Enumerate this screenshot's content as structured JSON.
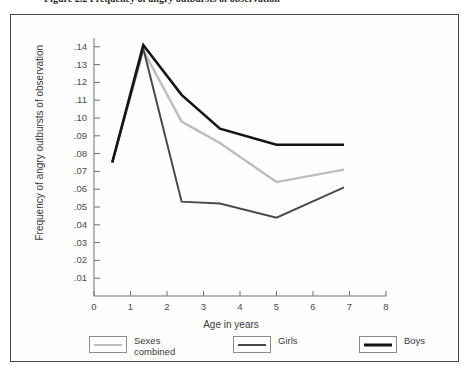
{
  "figure": {
    "caption": "Figure 2.2  Frequency of angry outbursts of observation"
  },
  "chart_data": {
    "type": "line",
    "title": "",
    "xlabel": "Age in years",
    "ylabel": "Frequency of angry outbursts of observation",
    "xlim": [
      0,
      8
    ],
    "ylim": [
      0,
      0.145
    ],
    "grid": false,
    "legend_position": "bottom",
    "xticks": [
      "0",
      "1",
      "2",
      "3",
      "4",
      "5",
      "6",
      "7",
      "8"
    ],
    "xtick_values": [
      0,
      1,
      2,
      3,
      4,
      5,
      6,
      7,
      8
    ],
    "yticks": [
      ".01",
      ".02",
      ".03",
      ".04",
      ".05",
      ".06",
      ".07",
      ".08",
      ".09",
      ".10",
      ".11",
      ".12",
      ".13",
      ".14"
    ],
    "ytick_values": [
      0.01,
      0.02,
      0.03,
      0.04,
      0.05,
      0.06,
      0.07,
      0.08,
      0.09,
      0.1,
      0.11,
      0.12,
      0.13,
      0.14
    ],
    "x": [
      0.5,
      1.35,
      2.4,
      3.45,
      5.0,
      6.85
    ],
    "series": [
      {
        "name": "Sexes combined",
        "legend_label": "Sexes\ncombined",
        "color": "#bdbdbd",
        "width": 2.4,
        "values": [
          0.075,
          0.138,
          0.098,
          0.086,
          0.064,
          0.071
        ]
      },
      {
        "name": "Girls",
        "legend_label": "Girls",
        "color": "#4a4a4a",
        "width": 2.0,
        "values": [
          0.075,
          0.139,
          0.053,
          0.052,
          0.044,
          0.061
        ]
      },
      {
        "name": "Boys",
        "legend_label": "Boys",
        "color": "#141414",
        "width": 2.6,
        "values": [
          0.075,
          0.141,
          0.113,
          0.094,
          0.085,
          0.085
        ]
      }
    ]
  }
}
